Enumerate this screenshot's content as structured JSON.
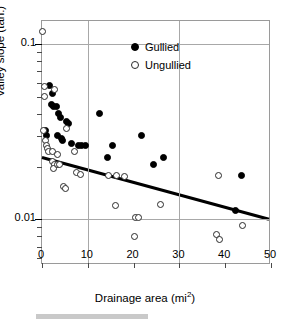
{
  "chart_data": {
    "type": "scatter",
    "title": "",
    "xlabel": "Drainage area (mi",
    "xlabel_sup": "2",
    "xlabel_suffix": ")",
    "ylabel": "Valley slope (tan.)",
    "xlim": [
      0,
      50
    ],
    "ylim": [
      0.0055,
      0.135
    ],
    "yscale": "log",
    "xticks": [
      0,
      10,
      20,
      30,
      40,
      50
    ],
    "xtick_labels": [
      "0",
      "10",
      "20",
      "30",
      "40",
      "50"
    ],
    "yticks_major": [
      0.1,
      0.01
    ],
    "ytick_labels": [
      "0.1",
      "0.01"
    ],
    "yticks_minor": [
      0.02,
      0.03,
      0.04,
      0.05,
      0.06,
      0.07,
      0.08,
      0.09,
      0.002,
      0.003,
      0.004,
      0.005,
      0.006,
      0.007,
      0.008,
      0.009
    ],
    "grid": {
      "horizontal_at": [
        0.1,
        0.01
      ],
      "vertical_at": [
        10,
        30
      ]
    },
    "legend_position": "upper right",
    "series": [
      {
        "name": "Gullied",
        "marker": "filled-circle",
        "color": "#000000",
        "points": [
          [
            1.6,
            0.058
          ],
          [
            2.3,
            0.052
          ],
          [
            2.0,
            0.045
          ],
          [
            2.6,
            0.044
          ],
          [
            3.2,
            0.044
          ],
          [
            3.6,
            0.04
          ],
          [
            4.0,
            0.038
          ],
          [
            3.4,
            0.03
          ],
          [
            4.2,
            0.029
          ],
          [
            4.4,
            0.028
          ],
          [
            0.7,
            0.032
          ],
          [
            1.0,
            0.03
          ],
          [
            5.4,
            0.036
          ],
          [
            5.8,
            0.035
          ],
          [
            6.4,
            0.027
          ],
          [
            8.0,
            0.0265
          ],
          [
            8.6,
            0.0265
          ],
          [
            9.6,
            0.0265
          ],
          [
            12.6,
            0.04
          ],
          [
            14.2,
            0.0225
          ],
          [
            15.4,
            0.0265
          ],
          [
            21.8,
            0.03
          ],
          [
            24.4,
            0.0205
          ],
          [
            26.6,
            0.0225
          ],
          [
            42.2,
            0.0113
          ],
          [
            43.6,
            0.0177
          ]
        ]
      },
      {
        "name": "Ungullied",
        "marker": "open-circle",
        "color": "#ffffff",
        "points": [
          [
            0.2,
            0.118
          ],
          [
            0.5,
            0.057
          ],
          [
            0.6,
            0.05
          ],
          [
            2.8,
            0.055
          ],
          [
            0.4,
            0.032
          ],
          [
            0.8,
            0.028
          ],
          [
            1.0,
            0.0265
          ],
          [
            1.2,
            0.0255
          ],
          [
            1.5,
            0.0245
          ],
          [
            2.2,
            0.0245
          ],
          [
            5.4,
            0.033
          ],
          [
            3.4,
            0.0235
          ],
          [
            2.4,
            0.0215
          ],
          [
            2.8,
            0.0205
          ],
          [
            2.6,
            0.0195
          ],
          [
            3.4,
            0.0205
          ],
          [
            3.8,
            0.0205
          ],
          [
            4.6,
            0.0155
          ],
          [
            5.2,
            0.015
          ],
          [
            7.2,
            0.0245
          ],
          [
            7.6,
            0.0185
          ],
          [
            8.4,
            0.018
          ],
          [
            14.6,
            0.0178
          ],
          [
            16.2,
            0.0178
          ],
          [
            18.0,
            0.0175
          ],
          [
            16.0,
            0.012
          ],
          [
            20.4,
            0.0103
          ],
          [
            21.0,
            0.0102
          ],
          [
            20.2,
            0.008
          ],
          [
            25.8,
            0.0122
          ],
          [
            38.2,
            0.0082
          ],
          [
            38.8,
            0.0077
          ],
          [
            38.6,
            0.0178
          ],
          [
            43.8,
            0.0092
          ]
        ]
      }
    ],
    "trend_line": {
      "label": "regression",
      "color": "#000000",
      "width_px": 3,
      "x_start": 0,
      "y_start": 0.0222,
      "x_end": 50,
      "y_end": 0.0098
    }
  },
  "legend": {
    "items": [
      {
        "label": "Gullied",
        "marker": "filled-circle"
      },
      {
        "label": "Ungullied",
        "marker": "open-circle"
      }
    ]
  }
}
